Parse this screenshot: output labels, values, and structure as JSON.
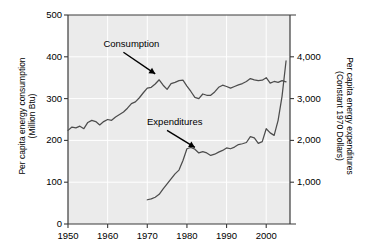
{
  "chart_data": {
    "type": "line",
    "title": "",
    "xlabel": "",
    "ylabel": "Per capita energy consumption (Million Btu)",
    "y2label": "Per capita energy expenditures (Constant 1970 Dollars)",
    "xlim": [
      1950,
      2006
    ],
    "ylim": [
      0,
      500
    ],
    "y2lim": [
      0,
      5000
    ],
    "grid": true,
    "legend": "none",
    "plot_background": "#ebebeb",
    "gridline_color": "#ffffff",
    "line_color": "#4d4d4d",
    "xticks": [
      "1950",
      "1960",
      "1970",
      "1980",
      "1990",
      "2000"
    ],
    "xtick_values": [
      1950,
      1960,
      1970,
      1980,
      1990,
      2000
    ],
    "yticks_left": [
      "0",
      "100",
      "200",
      "300",
      "400",
      "500"
    ],
    "ytick_left_values": [
      0,
      100,
      200,
      300,
      400,
      500
    ],
    "yticks_right": [
      "1,000",
      "2,000",
      "3,000",
      "4,000"
    ],
    "ytick_right_values": [
      1000,
      2000,
      3000,
      4000
    ],
    "axis_titles": {
      "left_line1": "Per capita energy consumption",
      "left_line2": "(Million Btu)",
      "right_line1": "Per capita energy expenditures",
      "right_line2": "(Constant 1970 Dollars)"
    },
    "annotations": [
      {
        "text": "Consumption",
        "x": 1966,
        "y": 430,
        "arrow_to_x": 1972,
        "arrow_to_y": 352
      },
      {
        "text": "Expenditures",
        "x": 1977,
        "y": 243,
        "arrow_to_x": 1982,
        "arrow_to_y": 1760
      }
    ],
    "series": [
      {
        "name": "Consumption",
        "axis": "left",
        "units": "Million Btu per capita",
        "x": [
          1950,
          1951,
          1952,
          1953,
          1954,
          1955,
          1956,
          1957,
          1958,
          1959,
          1960,
          1961,
          1962,
          1963,
          1964,
          1965,
          1966,
          1967,
          1968,
          1969,
          1970,
          1971,
          1972,
          1973,
          1974,
          1975,
          1976,
          1977,
          1978,
          1979,
          1980,
          1981,
          1982,
          1983,
          1984,
          1985,
          1986,
          1987,
          1988,
          1989,
          1990,
          1991,
          1992,
          1993,
          1994,
          1995,
          1996,
          1997,
          1998,
          1999,
          2000,
          2001,
          2002,
          2003,
          2004,
          2005
        ],
        "y": [
          224,
          232,
          230,
          234,
          228,
          243,
          248,
          245,
          237,
          245,
          250,
          248,
          256,
          262,
          268,
          277,
          288,
          292,
          302,
          314,
          325,
          327,
          335,
          345,
          332,
          322,
          336,
          339,
          343,
          344,
          330,
          317,
          303,
          300,
          311,
          308,
          308,
          316,
          327,
          332,
          329,
          325,
          329,
          333,
          336,
          341,
          348,
          345,
          343,
          344,
          350,
          337,
          341,
          339,
          343,
          340
        ]
      },
      {
        "name": "Expenditures",
        "axis": "right",
        "units": "Constant 1970 Dollars per capita",
        "x": [
          1970,
          1971,
          1972,
          1973,
          1974,
          1975,
          1976,
          1977,
          1978,
          1979,
          1980,
          1981,
          1982,
          1983,
          1984,
          1985,
          1986,
          1987,
          1988,
          1989,
          1990,
          1991,
          1992,
          1993,
          1994,
          1995,
          1996,
          1997,
          1998,
          1999,
          2000,
          2001,
          2002,
          2003,
          2004,
          2005
        ],
        "y": [
          580,
          600,
          640,
          710,
          840,
          960,
          1080,
          1200,
          1290,
          1520,
          1800,
          1830,
          1790,
          1700,
          1730,
          1700,
          1640,
          1670,
          1720,
          1760,
          1820,
          1800,
          1840,
          1900,
          1920,
          1950,
          2090,
          2060,
          1930,
          1970,
          2280,
          2180,
          2120,
          2480,
          3060,
          3900
        ]
      }
    ]
  }
}
